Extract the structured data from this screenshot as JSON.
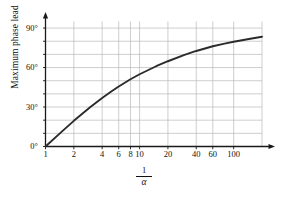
{
  "chart_data": {
    "type": "line",
    "title": "",
    "subtitle": "",
    "xlabel": "1/α",
    "xlabel_numerator": "1",
    "xlabel_denominator": "α",
    "ylabel": "Maximum phase lead",
    "xscale": "log",
    "yscale": "linear",
    "xlim": [
      1,
      200
    ],
    "ylim": [
      0,
      95
    ],
    "grid": true,
    "legend": null,
    "x_tick_labels": [
      "1",
      "2",
      "4",
      "6",
      "8",
      "10",
      "20",
      "40",
      "60",
      "100"
    ],
    "x_tick_values": [
      1,
      2,
      4,
      6,
      8,
      10,
      20,
      40,
      60,
      100
    ],
    "y_tick_labels": [
      "0°",
      "30°",
      "60°",
      "90°"
    ],
    "y_tick_values": [
      0,
      30,
      60,
      90
    ],
    "y_minor_gridlines": [
      10,
      20,
      40,
      50,
      70,
      80
    ],
    "x_minor_gridlines": [
      2,
      4,
      6,
      8,
      10,
      20,
      40,
      60,
      100
    ],
    "series": [
      {
        "name": "Maximum phase lead",
        "formula": "phi_max = arcsin((x - 1) / (x + 1))",
        "x": [
          1,
          1.5,
          2,
          3,
          4,
          5,
          6,
          8,
          10,
          15,
          20,
          30,
          40,
          60,
          80,
          100,
          150,
          200
        ],
        "values": [
          0,
          11.5,
          19.5,
          30,
          36.9,
          41.8,
          45.6,
          51.1,
          54.9,
          61.0,
          64.8,
          69.6,
          72.6,
          76.2,
          78.2,
          79.6,
          81.9,
          83.4
        ]
      }
    ],
    "colors": {
      "curve": "#2b2b2b",
      "grid": "#b9b9b9",
      "axis": "#1a1a1a",
      "text": "#111111",
      "background": "#ffffff"
    }
  }
}
